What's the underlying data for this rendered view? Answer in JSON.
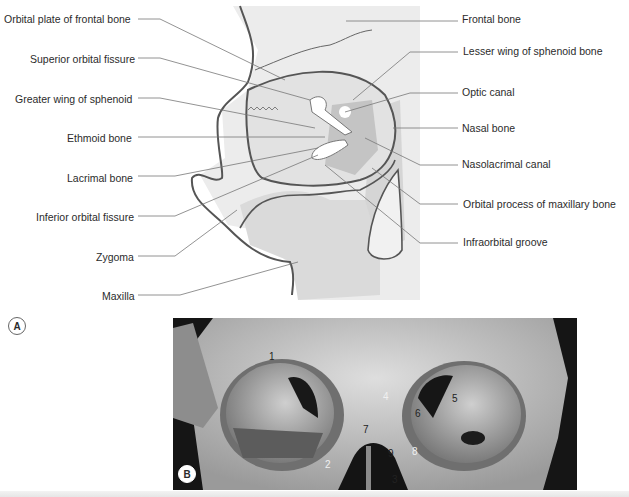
{
  "panel_a": {
    "badge": "A",
    "labels_left": [
      {
        "text": "Orbital plate of frontal bone",
        "x": 4,
        "y": 13
      },
      {
        "text": "Superior orbital fissure",
        "x": 30,
        "y": 53
      },
      {
        "text": "Greater wing of sphenoid",
        "x": 15,
        "y": 93
      },
      {
        "text": "Ethmoid bone",
        "x": 67,
        "y": 132
      },
      {
        "text": "Lacrimal bone",
        "x": 67,
        "y": 172
      },
      {
        "text": "Inferior orbital fissure",
        "x": 36,
        "y": 211
      },
      {
        "text": "Zygoma",
        "x": 96,
        "y": 251
      },
      {
        "text": "Maxilla",
        "x": 102,
        "y": 290
      }
    ],
    "labels_right": [
      {
        "text": "Frontal bone",
        "x": 462,
        "y": 13
      },
      {
        "text": "Lesser wing of sphenoid bone",
        "x": 463,
        "y": 45
      },
      {
        "text": "Optic canal",
        "x": 462,
        "y": 86
      },
      {
        "text": "Nasal bone",
        "x": 462,
        "y": 122
      },
      {
        "text": "Nasolacrimal canal",
        "x": 462,
        "y": 158
      },
      {
        "text": "Orbital process of maxillary bone",
        "x": 463,
        "y": 198
      },
      {
        "text": "Infraorbital groove",
        "x": 463,
        "y": 236
      }
    ]
  },
  "panel_b": {
    "badge": "B",
    "numbers": [
      {
        "text": "1",
        "x": 269,
        "y": 351,
        "white": false
      },
      {
        "text": "2",
        "x": 325,
        "y": 459,
        "white": true
      },
      {
        "text": "3",
        "x": 392,
        "y": 474,
        "white": false
      },
      {
        "text": "4",
        "x": 383,
        "y": 391,
        "white": true
      },
      {
        "text": "5",
        "x": 452,
        "y": 393,
        "white": false
      },
      {
        "text": "6",
        "x": 415,
        "y": 408,
        "white": false
      },
      {
        "text": "7",
        "x": 363,
        "y": 424,
        "white": false
      },
      {
        "text": "8",
        "x": 412,
        "y": 446,
        "white": true
      },
      {
        "text": "9",
        "x": 388,
        "y": 448,
        "white": false
      }
    ]
  },
  "colors": {
    "bone_light": "#e9e9e9",
    "bone_mid": "#d3d3d3",
    "bone_dark": "#b9b9b9",
    "outline": "#555555",
    "leader": "#777777",
    "text": "#2b2b2b"
  }
}
